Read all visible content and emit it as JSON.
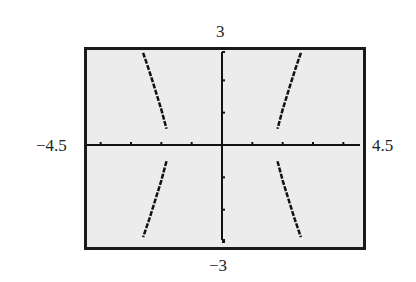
{
  "chart_data": {
    "type": "line",
    "title": "",
    "xlabel": "",
    "ylabel": "",
    "xlim": [
      -4.5,
      4.5
    ],
    "ylim": [
      -3,
      3
    ],
    "xscale_tick": 1,
    "yscale_tick": 1,
    "grid": false,
    "window_labels": {
      "xmin": "−4.5",
      "xmax": "4.5",
      "ymin": "−3",
      "ymax": "3"
    },
    "series": [
      {
        "name": "upper-left branch",
        "points": [
          [
            -2.6,
            2.85
          ],
          [
            -2.4,
            2.3
          ],
          [
            -2.2,
            1.7
          ],
          [
            -2.0,
            1.1
          ],
          [
            -1.83,
            0.5
          ]
        ]
      },
      {
        "name": "lower-left branch",
        "points": [
          [
            -1.83,
            -0.5
          ],
          [
            -2.0,
            -1.1
          ],
          [
            -2.2,
            -1.7
          ],
          [
            -2.4,
            -2.3
          ],
          [
            -2.6,
            -2.85
          ]
        ]
      },
      {
        "name": "upper-right branch",
        "points": [
          [
            2.6,
            2.85
          ],
          [
            2.4,
            2.3
          ],
          [
            2.2,
            1.7
          ],
          [
            2.0,
            1.1
          ],
          [
            1.83,
            0.5
          ]
        ]
      },
      {
        "name": "lower-right branch",
        "points": [
          [
            1.83,
            -0.5
          ],
          [
            2.0,
            -1.1
          ],
          [
            2.2,
            -1.7
          ],
          [
            2.4,
            -2.3
          ],
          [
            2.6,
            -2.85
          ]
        ]
      }
    ]
  },
  "colors": {
    "screen_bg": "#ececec",
    "frame": "#1a1a1a",
    "curve": "#111111"
  }
}
